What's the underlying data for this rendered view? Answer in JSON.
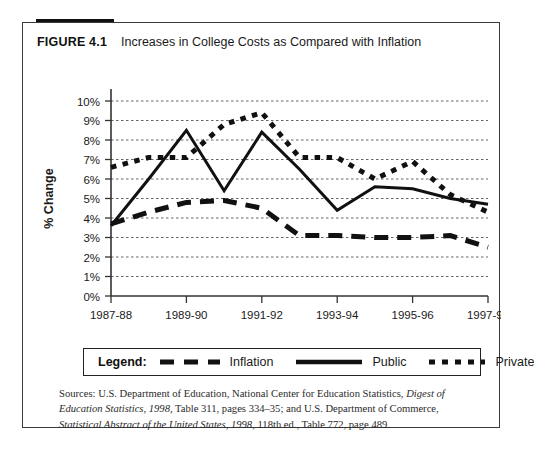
{
  "figure": {
    "number": "FIGURE 4.1",
    "title": "Increases in College Costs as Compared with Inflation"
  },
  "legend": {
    "title": "Legend:",
    "entries": [
      {
        "label": "Inflation",
        "style": "dashed",
        "color": "#111111",
        "icon": "dashed-line-icon"
      },
      {
        "label": "Public",
        "style": "solid",
        "color": "#111111",
        "icon": "solid-line-icon"
      },
      {
        "label": "Private",
        "style": "dotted",
        "color": "#111111",
        "icon": "dotted-line-icon"
      }
    ]
  },
  "source": {
    "line1_a": "Sources: U.S. Department of Education, National Center for Education Statistics, ",
    "line1_i": "Digest of Education",
    "line2_i": "Statistics, 1998,",
    "line2_a": " Table 311, pages 334–35; and U.S. Department of Commerce, ",
    "line2_i2": "Statistical Abstract of the",
    "line3_i": "United States, 1998,",
    "line3_a": " 118th ed., Table 772, page 489."
  },
  "chart_data": {
    "type": "line",
    "title": "Increases in College Costs as Compared with Inflation",
    "xlabel": "",
    "ylabel": "% Change",
    "ylim": [
      0,
      10
    ],
    "ytick_labels": [
      "0%",
      "1%",
      "2%",
      "3%",
      "4%",
      "5%",
      "6%",
      "7%",
      "8%",
      "9%",
      "10%"
    ],
    "ytick_values": [
      0,
      1,
      2,
      3,
      4,
      5,
      6,
      7,
      8,
      9,
      10
    ],
    "xtick_labels": [
      "1987-88",
      "1989-90",
      "1991-92",
      "1993-94",
      "1995-96",
      "1997-98"
    ],
    "xtick_values": [
      0,
      2,
      4,
      6,
      8,
      10
    ],
    "x": [
      0,
      1,
      2,
      3,
      4,
      5,
      6,
      7,
      8,
      9,
      10
    ],
    "x_labels_all": [
      "1987-88",
      "1988-89",
      "1989-90",
      "1990-91",
      "1991-92",
      "1992-93",
      "1993-94",
      "1994-95",
      "1995-96",
      "1996-97",
      "1997-98"
    ],
    "grid": "horizontal-dashed",
    "legend_position": "below-plot",
    "series": [
      {
        "name": "Inflation",
        "style": "dashed",
        "color": "#111111",
        "values": [
          3.7,
          4.3,
          4.8,
          4.9,
          4.5,
          3.1,
          3.1,
          3.0,
          3.0,
          3.1,
          2.5
        ]
      },
      {
        "name": "Public",
        "style": "solid",
        "color": "#111111",
        "values": [
          3.6,
          6.0,
          8.5,
          5.4,
          8.4,
          6.5,
          4.4,
          5.6,
          5.5,
          5.0,
          4.7
        ]
      },
      {
        "name": "Private",
        "style": "dotted",
        "color": "#111111",
        "values": [
          6.6,
          7.1,
          7.1,
          8.8,
          9.4,
          7.1,
          7.1,
          6.0,
          6.9,
          5.2,
          4.3
        ]
      }
    ]
  }
}
